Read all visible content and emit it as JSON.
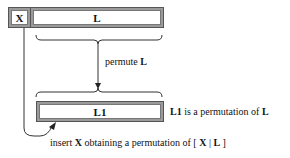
{
  "diagram": {
    "boxes": {
      "x": {
        "label": "X"
      },
      "l": {
        "label": "L"
      },
      "l1": {
        "label": "L1"
      }
    },
    "labels": {
      "permute": {
        "prefix": "permute ",
        "bold": "L"
      },
      "l1_desc": {
        "bold1": "L1",
        "middle": " is a permutation of ",
        "bold2": "L"
      },
      "insert": {
        "prefix": "insert ",
        "bold1": "X",
        "middle": " obtaining a permutation of [ ",
        "bold2": "X",
        "sep": " | ",
        "bold3": "L",
        "suffix": " ]"
      }
    },
    "colors": {
      "box_border": "#9a9a9a",
      "box_fill": "#ffffff",
      "line": "#222222"
    }
  }
}
